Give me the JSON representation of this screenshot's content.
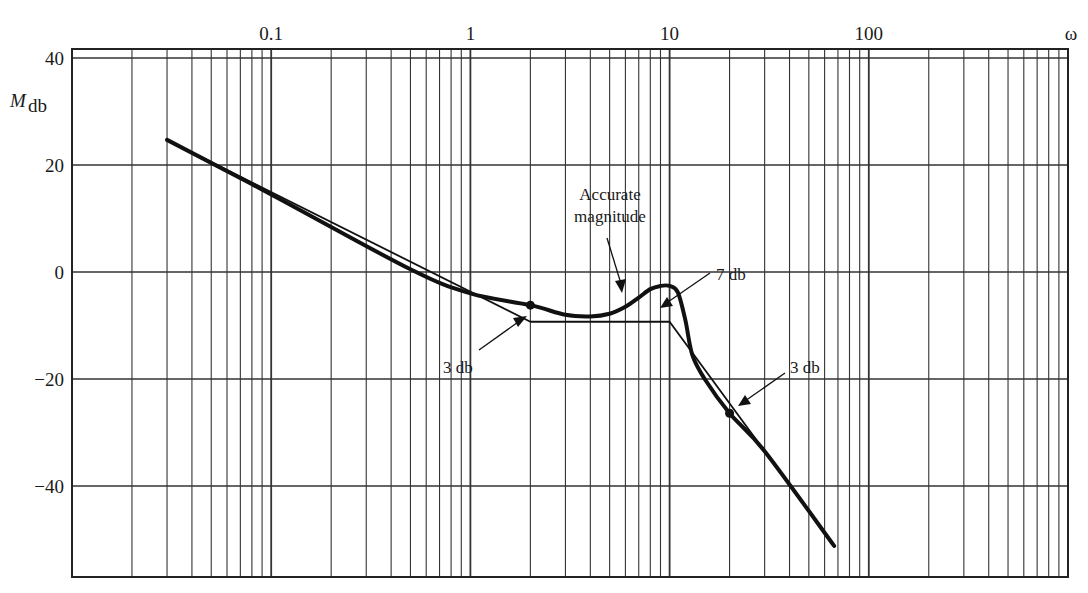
{
  "chart_data": {
    "type": "line",
    "title": "",
    "xlabel": "ω",
    "ylabel": "M_db",
    "xscale": "log",
    "xlim": [
      0.01,
      1000
    ],
    "ylim": [
      -60,
      40
    ],
    "grid": true,
    "x_tick_labels": [
      "0.1",
      "1",
      "10",
      "100"
    ],
    "x_ticks": [
      0.1,
      1,
      10,
      100
    ],
    "y_tick_labels": [
      "40",
      "20",
      "0",
      "−20",
      "−40"
    ],
    "y_ticks": [
      40,
      20,
      0,
      -20,
      -40
    ],
    "series": [
      {
        "name": "Asymptotic magnitude",
        "style": "thin",
        "x": [
          0.03,
          2,
          10,
          67
        ],
        "y": [
          24.7,
          -9.3,
          -9.3,
          -51.2
        ]
      },
      {
        "name": "Accurate magnitude",
        "style": "thick",
        "x": [
          0.03,
          0.1,
          0.5,
          1,
          2,
          3,
          4,
          5,
          6,
          7,
          8,
          9,
          10,
          11,
          12,
          13,
          15,
          20,
          30,
          67
        ],
        "y": [
          24.7,
          14.5,
          0.5,
          -4.0,
          -6.2,
          -8.0,
          -8.3,
          -7.8,
          -6.5,
          -4.8,
          -3.2,
          -2.6,
          -2.6,
          -3.8,
          -9.0,
          -15.5,
          -20.0,
          -26.4,
          -33.5,
          -51.2
        ]
      }
    ],
    "markers": [
      {
        "x": 2,
        "y": -6.2,
        "label": "3 db point (low)"
      },
      {
        "x": 20,
        "y": -26.4,
        "label": "3 db point (high)"
      }
    ],
    "annotations": [
      {
        "text_lines": [
          "Accurate",
          "magnitude"
        ],
        "points_to": "accurate curve near ω≈6"
      },
      {
        "text": "7 db",
        "points_to": "resonant peak near ω≈10"
      },
      {
        "text": "3 db",
        "points_to": "asymptote corner at ω=2"
      },
      {
        "text": "3 db",
        "points_to": "ω=20 on high-freq slope"
      }
    ]
  },
  "labels": {
    "x_axis_symbol": "ω",
    "y_axis_M": "M",
    "y_axis_sub": "db",
    "ann_accurate_1": "Accurate",
    "ann_accurate_2": "magnitude",
    "ann_7db": "7 db",
    "ann_3db_low": "3 db",
    "ann_3db_high": "3 db"
  }
}
